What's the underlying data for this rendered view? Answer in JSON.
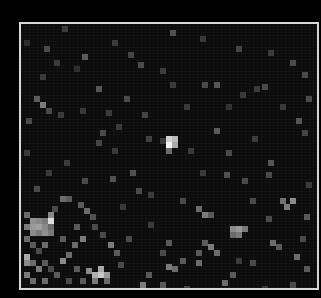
{
  "image": {
    "background": "#000000",
    "frame": {
      "x": 19,
      "y": 22,
      "width": 300,
      "height": 268,
      "border_color": "#d8d8d8",
      "fill": "#0b0b0b"
    },
    "block_size": 6,
    "pixels": [
      [
        62,
        26,
        "#3a3a3a"
      ],
      [
        44,
        46,
        "#4a4a4a"
      ],
      [
        24,
        40,
        "#2e2e2e"
      ],
      [
        82,
        54,
        "#5a5a5a"
      ],
      [
        138,
        62,
        "#4a4a4a"
      ],
      [
        160,
        68,
        "#3c3c3c"
      ],
      [
        112,
        40,
        "#3a3a3a"
      ],
      [
        74,
        66,
        "#2e2e2e"
      ],
      [
        54,
        60,
        "#3a3a3a"
      ],
      [
        128,
        52,
        "#444444"
      ],
      [
        170,
        30,
        "#505050"
      ],
      [
        200,
        36,
        "#3a3a3a"
      ],
      [
        236,
        46,
        "#444444"
      ],
      [
        268,
        50,
        "#3a3a3a"
      ],
      [
        290,
        60,
        "#4a4a4a"
      ],
      [
        302,
        72,
        "#4a4a4a"
      ],
      [
        214,
        82,
        "#555555"
      ],
      [
        262,
        84,
        "#4a4a4a"
      ],
      [
        240,
        92,
        "#3a3a3a"
      ],
      [
        202,
        82,
        "#4a4a4a"
      ],
      [
        170,
        82,
        "#3a3a3a"
      ],
      [
        40,
        102,
        "#7a7a7a"
      ],
      [
        34,
        96,
        "#5a5a5a"
      ],
      [
        46,
        108,
        "#4a4a4a"
      ],
      [
        26,
        118,
        "#4a4a4a"
      ],
      [
        58,
        112,
        "#3a3a3a"
      ],
      [
        80,
        108,
        "#3a3a3a"
      ],
      [
        100,
        130,
        "#4a4a4a"
      ],
      [
        116,
        124,
        "#3a3a3a"
      ],
      [
        146,
        136,
        "#404040"
      ],
      [
        106,
        110,
        "#3a3a3a"
      ],
      [
        40,
        74,
        "#3a3a3a"
      ],
      [
        96,
        86,
        "#555555"
      ],
      [
        124,
        96,
        "#4a4a4a"
      ],
      [
        142,
        112,
        "#444444"
      ],
      [
        96,
        140,
        "#444444"
      ],
      [
        112,
        148,
        "#3a3a3a"
      ],
      [
        160,
        138,
        "#3a3a3a"
      ],
      [
        166,
        136,
        "#d0d0d0"
      ],
      [
        172,
        136,
        "#bababa"
      ],
      [
        166,
        142,
        "#f2f2f2"
      ],
      [
        172,
        142,
        "#a8a8a8"
      ],
      [
        166,
        148,
        "#6a6a6a"
      ],
      [
        188,
        148,
        "#3a3a3a"
      ],
      [
        214,
        128,
        "#5a5a5a"
      ],
      [
        226,
        150,
        "#4a4a4a"
      ],
      [
        252,
        136,
        "#3a3a3a"
      ],
      [
        268,
        160,
        "#555555"
      ],
      [
        296,
        118,
        "#555555"
      ],
      [
        302,
        130,
        "#444444"
      ],
      [
        306,
        96,
        "#4a4a4a"
      ],
      [
        280,
        104,
        "#3a3a3a"
      ],
      [
        224,
        172,
        "#505050"
      ],
      [
        266,
        172,
        "#4a4a4a"
      ],
      [
        200,
        170,
        "#3a3a3a"
      ],
      [
        242,
        178,
        "#4a4a4a"
      ],
      [
        24,
        150,
        "#3a3a3a"
      ],
      [
        46,
        170,
        "#3a3a3a"
      ],
      [
        64,
        160,
        "#3a3a3a"
      ],
      [
        82,
        178,
        "#4a4a4a"
      ],
      [
        130,
        170,
        "#505050"
      ],
      [
        110,
        176,
        "#505050"
      ],
      [
        34,
        186,
        "#4a4a4a"
      ],
      [
        60,
        196,
        "#6a6a6a"
      ],
      [
        66,
        196,
        "#5a5a5a"
      ],
      [
        52,
        206,
        "#4a4a4a"
      ],
      [
        78,
        202,
        "#5a5a5a"
      ],
      [
        84,
        208,
        "#6a6a6a"
      ],
      [
        90,
        214,
        "#505050"
      ],
      [
        24,
        212,
        "#6a6a6a"
      ],
      [
        30,
        218,
        "#909090"
      ],
      [
        36,
        218,
        "#8a8a8a"
      ],
      [
        42,
        218,
        "#7a7a7a"
      ],
      [
        24,
        224,
        "#7a7a7a"
      ],
      [
        30,
        224,
        "#9a9a9a"
      ],
      [
        36,
        224,
        "#a0a0a0"
      ],
      [
        42,
        224,
        "#8a8a8a"
      ],
      [
        48,
        224,
        "#6a6a6a"
      ],
      [
        48,
        212,
        "#8a8a8a"
      ],
      [
        48,
        218,
        "#dcdcdc"
      ],
      [
        48,
        230,
        "#7a7a7a"
      ],
      [
        30,
        230,
        "#8a8a8a"
      ],
      [
        36,
        230,
        "#7a7a7a"
      ],
      [
        42,
        230,
        "#909090"
      ],
      [
        24,
        236,
        "#6a6a6a"
      ],
      [
        30,
        242,
        "#5a5a5a"
      ],
      [
        36,
        248,
        "#4a4a4a"
      ],
      [
        42,
        242,
        "#6a6a6a"
      ],
      [
        24,
        254,
        "#aaaaaa"
      ],
      [
        24,
        260,
        "#8a8a8a"
      ],
      [
        30,
        260,
        "#6a6a6a"
      ],
      [
        36,
        266,
        "#7a7a7a"
      ],
      [
        42,
        260,
        "#5a5a5a"
      ],
      [
        48,
        266,
        "#4a4a4a"
      ],
      [
        24,
        272,
        "#7a7a7a"
      ],
      [
        30,
        278,
        "#6a6a6a"
      ],
      [
        42,
        278,
        "#6a6a6a"
      ],
      [
        54,
        272,
        "#5a5a5a"
      ],
      [
        60,
        258,
        "#8a8a8a"
      ],
      [
        66,
        252,
        "#6a6a6a"
      ],
      [
        72,
        242,
        "#6a6a6a"
      ],
      [
        60,
        236,
        "#5a5a5a"
      ],
      [
        80,
        236,
        "#7a7a7a"
      ],
      [
        74,
        224,
        "#5a5a5a"
      ],
      [
        92,
        224,
        "#4a4a4a"
      ],
      [
        100,
        232,
        "#4a4a4a"
      ],
      [
        108,
        242,
        "#7a7a7a"
      ],
      [
        114,
        250,
        "#5a5a5a"
      ],
      [
        86,
        268,
        "#8a8a8a"
      ],
      [
        92,
        272,
        "#b0b0b0"
      ],
      [
        98,
        272,
        "#c8c8c8"
      ],
      [
        104,
        272,
        "#9a9a9a"
      ],
      [
        98,
        266,
        "#a8a8a8"
      ],
      [
        92,
        278,
        "#7a7a7a"
      ],
      [
        104,
        278,
        "#6a6a6a"
      ],
      [
        80,
        278,
        "#5a5a5a"
      ],
      [
        74,
        266,
        "#5a5a5a"
      ],
      [
        66,
        278,
        "#4a4a4a"
      ],
      [
        118,
        262,
        "#4a4a4a"
      ],
      [
        126,
        236,
        "#4a4a4a"
      ],
      [
        136,
        188,
        "#4a4a4a"
      ],
      [
        148,
        192,
        "#3a3a3a"
      ],
      [
        180,
        198,
        "#4a4a4a"
      ],
      [
        196,
        206,
        "#6a6a6a"
      ],
      [
        202,
        212,
        "#7a7a7a"
      ],
      [
        208,
        212,
        "#5a5a5a"
      ],
      [
        230,
        226,
        "#8a8a8a"
      ],
      [
        236,
        226,
        "#9a9a9a"
      ],
      [
        242,
        226,
        "#7a7a7a"
      ],
      [
        230,
        232,
        "#6a6a6a"
      ],
      [
        236,
        232,
        "#7a7a7a"
      ],
      [
        208,
        244,
        "#7a7a7a"
      ],
      [
        202,
        240,
        "#5a5a5a"
      ],
      [
        196,
        250,
        "#5a5a5a"
      ],
      [
        214,
        250,
        "#6a6a6a"
      ],
      [
        196,
        260,
        "#6a6a6a"
      ],
      [
        166,
        240,
        "#5a5a5a"
      ],
      [
        160,
        250,
        "#4a4a4a"
      ],
      [
        180,
        258,
        "#5a5a5a"
      ],
      [
        166,
        264,
        "#7a7a7a"
      ],
      [
        172,
        266,
        "#6a6a6a"
      ],
      [
        146,
        272,
        "#5a5a5a"
      ],
      [
        140,
        282,
        "#7a7a7a"
      ],
      [
        160,
        282,
        "#5a5a5a"
      ],
      [
        184,
        286,
        "#4a4a4a"
      ],
      [
        222,
        280,
        "#6a6a6a"
      ],
      [
        230,
        272,
        "#5a5a5a"
      ],
      [
        250,
        260,
        "#4a4a4a"
      ],
      [
        236,
        258,
        "#3a3a3a"
      ],
      [
        280,
        198,
        "#707070"
      ],
      [
        290,
        198,
        "#8a8a8a"
      ],
      [
        284,
        204,
        "#7a7a7a"
      ],
      [
        266,
        216,
        "#4a4a4a"
      ],
      [
        304,
        214,
        "#5a5a5a"
      ],
      [
        300,
        236,
        "#4a4a4a"
      ],
      [
        270,
        240,
        "#6a6a6a"
      ],
      [
        276,
        244,
        "#5a5a5a"
      ],
      [
        294,
        254,
        "#6a6a6a"
      ],
      [
        304,
        266,
        "#5a5a5a"
      ],
      [
        290,
        282,
        "#4a4a4a"
      ],
      [
        262,
        286,
        "#3a3a3a"
      ],
      [
        250,
        198,
        "#4a4a4a"
      ],
      [
        306,
        182,
        "#3a3a3a"
      ],
      [
        120,
        204,
        "#3a3a3a"
      ],
      [
        148,
        222,
        "#3a3a3a"
      ],
      [
        254,
        86,
        "#3a3a3a"
      ],
      [
        184,
        104,
        "#3a3a3a"
      ],
      [
        226,
        104,
        "#333333"
      ]
    ]
  }
}
